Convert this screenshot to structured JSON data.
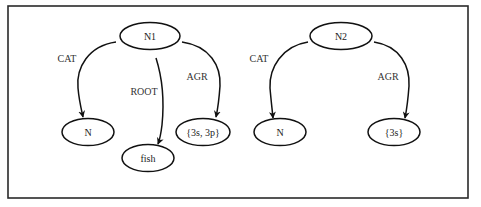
{
  "figure": {
    "frame": {
      "x": 8,
      "y": 6,
      "width": 460,
      "height": 192,
      "color": "#2a2a2a"
    },
    "ink_color": "#111111"
  },
  "graphs": [
    {
      "id": "graph-1",
      "nodes": [
        {
          "id": "n1",
          "label": "N1",
          "cx": 150,
          "cy": 36,
          "rx": 30,
          "ry": 13.5
        },
        {
          "id": "n1-cat",
          "label": "N",
          "cx": 88,
          "cy": 132,
          "rx": 26,
          "ry": 13.5
        },
        {
          "id": "n1-root",
          "label": "fish",
          "cx": 148,
          "cy": 158,
          "rx": 26,
          "ry": 13.5
        },
        {
          "id": "n1-agr",
          "label": "{3s, 3p}",
          "cx": 203,
          "cy": 132,
          "rx": 27,
          "ry": 13.5
        }
      ],
      "edges": [
        {
          "label": "CAT",
          "from": "N1",
          "to": "N",
          "label_x": 67,
          "label_y": 58
        },
        {
          "label": "ROOT",
          "from": "N1",
          "to": "fish",
          "label_x": 144,
          "label_y": 91
        },
        {
          "label": "AGR",
          "from": "N1",
          "to": "{3s, 3p}",
          "label_x": 197,
          "label_y": 76
        }
      ]
    },
    {
      "id": "graph-2",
      "nodes": [
        {
          "id": "n2",
          "label": "N2",
          "cx": 341,
          "cy": 36,
          "rx": 31,
          "ry": 13.5
        },
        {
          "id": "n2-cat",
          "label": "N",
          "cx": 280,
          "cy": 132,
          "rx": 26,
          "ry": 13.5
        },
        {
          "id": "n2-agr",
          "label": "{3s}",
          "cx": 394,
          "cy": 132,
          "rx": 26,
          "ry": 13.5
        }
      ],
      "edges": [
        {
          "label": "CAT",
          "from": "N2",
          "to": "N",
          "label_x": 259,
          "label_y": 58
        },
        {
          "label": "AGR",
          "from": "N2",
          "to": "{3s}",
          "label_x": 388,
          "label_y": 76
        }
      ]
    }
  ]
}
